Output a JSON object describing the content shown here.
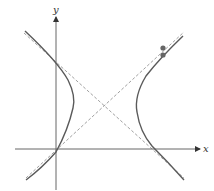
{
  "diagram": {
    "type": "hyperbola",
    "axes": {
      "x_label": "x",
      "y_label": "y"
    },
    "colors": {
      "axis": "#555555",
      "curve": "#5a5a5a",
      "asymptote": "#999999",
      "point": "#666666"
    },
    "elements": {
      "branches": [
        "left-branch",
        "right-branch"
      ],
      "asymptotes": [
        "asymptote-descending",
        "asymptote-ascending"
      ],
      "points": 2
    }
  }
}
